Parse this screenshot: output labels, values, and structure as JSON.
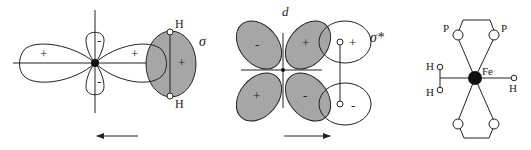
{
  "panels": [
    {
      "id": "sigma-donation",
      "lobe_signs": [
        "+",
        "+",
        "-",
        "-"
      ],
      "overlap_label": "σ",
      "overlap_sign": "+",
      "atoms": [
        "H",
        "H"
      ],
      "arrow_direction": "left"
    },
    {
      "id": "d-backdonation",
      "orbital_label": "d",
      "lobe_signs": [
        "-",
        "+",
        "+",
        "-"
      ],
      "antibonding_label": "σ*",
      "antibonding_signs": [
        "+",
        "-"
      ],
      "arrow_direction": "right"
    },
    {
      "id": "fe-complex",
      "center_atom": "Fe",
      "ligand_atoms": [
        "P",
        "P"
      ],
      "hydrogen_atoms": [
        "H",
        "H",
        "H"
      ]
    }
  ],
  "colors": {
    "line": "#222222",
    "shade": "#a6a6a6"
  }
}
